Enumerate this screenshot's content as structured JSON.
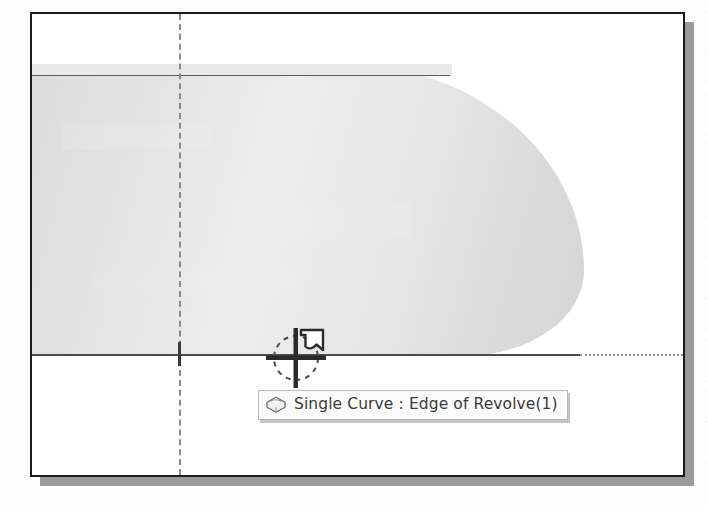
{
  "viewport": {
    "name": "cad-3d-viewport",
    "background_color": "#ffffff",
    "border_color": "#1b1b1b",
    "shadow_color": "#9a9a9a"
  },
  "geometry": {
    "solid_name": "revolved-solid-body",
    "solid_fill_color": "#e4e4e4",
    "silhouette_edge_color": "#5d5d5d",
    "baseline_color": "#4a4a4a",
    "baseline_dotted_color": "#8f8f8f",
    "axis_color": "#8a8a8a",
    "tick_color": "#3a3a3a"
  },
  "cursor": {
    "name": "curve-select-crosshair",
    "type": "crosshair-with-curve-glyph",
    "color": "#2e2e2e",
    "x": 264,
    "y": 344
  },
  "tooltip": {
    "icon": "single-curve-icon",
    "label": "Single Curve : Edge of Revolve(1)",
    "entity_type": "Single Curve",
    "entity_name": "Edge of Revolve(1)",
    "background_color": "#fbfbfb",
    "border_color": "#b7b7b7",
    "text_color": "#3a3a3a"
  }
}
